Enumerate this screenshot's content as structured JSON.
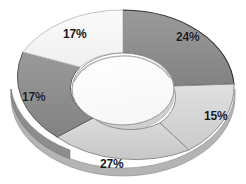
{
  "chart_data": {
    "type": "pie",
    "variant": "donut-3d",
    "title": "",
    "subtitle": "",
    "xlabel": "",
    "ylabel": "",
    "legend": false,
    "legend_position": "none",
    "grid": false,
    "background_color": "#ffffff",
    "label_color": "#15191c",
    "label_format": "percent",
    "total": 100,
    "categories": [
      "24%",
      "15%",
      "27%",
      "17%",
      "17%"
    ],
    "values": [
      24,
      15,
      27,
      17,
      17
    ],
    "slices": [
      {
        "label": "24%",
        "value": 24,
        "color": "#8e8e8e",
        "edge_color": "#3a3a3a",
        "start_angle": 0,
        "end_angle": 86.4,
        "label_x": 176,
        "label_y": 31
      },
      {
        "label": "15%",
        "value": 15,
        "color": "#d9d9d9",
        "edge_color": "#9a9a9a",
        "start_angle": 86.4,
        "end_angle": 140.4,
        "label_x": 204,
        "label_y": 110
      },
      {
        "label": "27%",
        "value": 27,
        "color": "#d2d2d2",
        "edge_color": "#9a9a9a",
        "start_angle": 140.4,
        "end_angle": 237.6,
        "label_x": 100,
        "label_y": 158
      },
      {
        "label": "17%",
        "value": 17,
        "color": "#8e8e8e",
        "edge_color": "#5a5a5a",
        "start_angle": 237.6,
        "end_angle": 298.8,
        "label_x": 22,
        "label_y": 91
      },
      {
        "label": "17%",
        "value": 17,
        "color": "#f5f5f5",
        "edge_color": "#c9c9c9",
        "start_angle": 298.8,
        "end_angle": 360,
        "label_x": 63,
        "label_y": 28
      }
    ],
    "geometry": {
      "center_x": 123,
      "center_y": 89,
      "outer_radius_x": 112,
      "outer_radius_y": 79,
      "inner_radius_x": 51,
      "inner_radius_y": 36,
      "depth": 9
    }
  }
}
